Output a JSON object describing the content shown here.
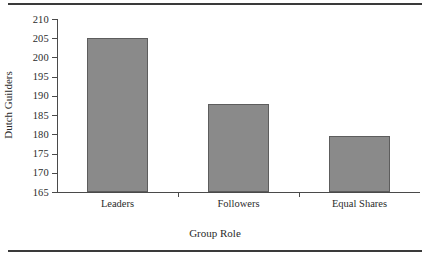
{
  "chart_data": {
    "type": "bar",
    "title": "",
    "categories": [
      "Leaders",
      "Followers",
      "Equal Shares"
    ],
    "values": [
      205,
      188,
      179.5
    ],
    "xlabel": "Group Role",
    "ylabel": "Dutch Guilders",
    "ylim": [
      165,
      210
    ],
    "ytick_step": 5,
    "yticks": [
      165,
      170,
      175,
      180,
      185,
      190,
      195,
      200,
      205,
      210
    ],
    "ytick_labels": [
      "165",
      "170",
      "175",
      "180",
      "185",
      "190",
      "195",
      "200",
      "205",
      "210"
    ],
    "grid": false,
    "legend": null,
    "bar_color": "#8a8a8a",
    "bar_edge_color": "#5d5d5d",
    "axis_color": "#4a4a4a",
    "rule_color": "#3a3a3a"
  }
}
